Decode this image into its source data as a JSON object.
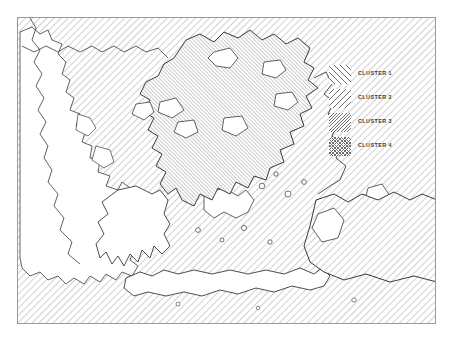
{
  "figure": {
    "type": "thematic-cluster-map",
    "region": "Greece and the Aegean Sea",
    "frame": {
      "x": 17,
      "y": 17,
      "width": 419,
      "height": 307,
      "border_color": "#9a9a9a"
    },
    "background_color": "#ffffff",
    "line_color": "#333333",
    "hatch_color": "#6e6e6e"
  },
  "legend": {
    "position": "top-right-inside-frame",
    "items": [
      {
        "id": "cluster-1",
        "label": "CLUSTER 1",
        "pattern": "diagonal-lines-45-sparse",
        "swatch_class": "hatch-c1"
      },
      {
        "id": "cluster-2",
        "label": "CLUSTER 2",
        "pattern": "diagonal-lines-135-sparse",
        "swatch_class": "hatch-c2"
      },
      {
        "id": "cluster-3",
        "label": "CLUSTER 3",
        "pattern": "diagonal-lines-135-dense",
        "swatch_class": "hatch-c3"
      },
      {
        "id": "cluster-4",
        "label": "CLUSTER 4",
        "pattern": "cross-hatch-fine",
        "swatch_class": "hatch-c4"
      }
    ]
  },
  "map_areas": [
    {
      "id": "sea-background",
      "name": "Sea and surrounding waters",
      "cluster": "cluster-1",
      "fill": "hatch-45-sparse"
    },
    {
      "id": "northern-mainland",
      "name": "Northern and central mainland",
      "cluster": "cluster-3",
      "fill": "hatch-135-dense"
    },
    {
      "id": "peloponnese",
      "name": "Peloponnese",
      "cluster": "none",
      "fill": "white"
    },
    {
      "id": "crete",
      "name": "Crete",
      "cluster": "none",
      "fill": "white"
    },
    {
      "id": "western-mainland",
      "name": "Western mainland",
      "cluster": "none",
      "fill": "white"
    },
    {
      "id": "eastern-coast",
      "name": "Eastern Aegean coast",
      "cluster": "cluster-1",
      "fill": "hatch-45-sparse"
    }
  ]
}
